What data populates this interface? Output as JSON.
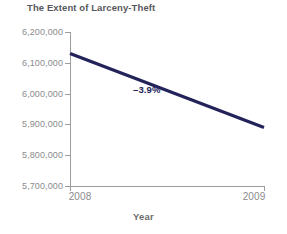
{
  "chart_data": {
    "type": "line",
    "title": "The Extent of Larceny-Theft",
    "xlabel": "Year",
    "ylabel": "",
    "x": [
      "2008",
      "2009"
    ],
    "categories": [
      "2008",
      "2009"
    ],
    "values": [
      6130000,
      5890000
    ],
    "series": [
      {
        "name": "Larceny-Theft Offenses",
        "values": [
          6130000,
          5890000
        ]
      }
    ],
    "ylim": [
      5700000,
      6200000
    ],
    "yticks": [
      6200000,
      6100000,
      6000000,
      5900000,
      5800000,
      5700000
    ],
    "ytick_labels": [
      "6,200,000",
      "6,100,000",
      "6,000,000",
      "5,900,000",
      "5,800,000",
      "5,700,000"
    ],
    "xtick_labels": [
      "2008",
      "2009"
    ],
    "grid": false,
    "legend": null,
    "annotations": [
      {
        "text": "–3.9%",
        "value": -3.9,
        "unit": "percent"
      }
    ],
    "colors": {
      "series_line": "#23235a",
      "annotation": "#23235a",
      "axis": "#9b9b9e",
      "tick_label": "#8b8b8e",
      "title": "#58585b",
      "axis_title": "#6d6d70",
      "background": "#ffffff"
    }
  },
  "axis": {
    "x_title": "Year"
  }
}
